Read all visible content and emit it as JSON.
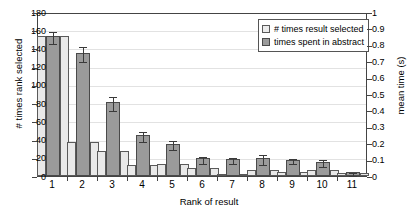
{
  "chart_data": {
    "type": "bar",
    "title": "",
    "xlabel": "Rank of result",
    "ylabel": "# times rank selected",
    "ylabel_right": "mean time (s)",
    "categories": [
      "1",
      "2",
      "3",
      "4",
      "5",
      "6",
      "7",
      "8",
      "9",
      "10",
      "11"
    ],
    "ylim": [
      0,
      180
    ],
    "yticks": [
      0,
      20,
      40,
      60,
      80,
      100,
      120,
      140,
      160,
      180
    ],
    "ylim_right": [
      0,
      1
    ],
    "yticks_right": [
      "0",
      "0.1",
      "0.2",
      "0.3",
      "0.4",
      "0.5",
      "0.6",
      "0.7",
      "0.8",
      "0.9",
      "1"
    ],
    "grid": true,
    "legend_position": "top-right",
    "series": [
      {
        "name": "# times result selected",
        "axis": "left",
        "color": "#e9e9e9",
        "values": [
          154,
          37,
          28,
          12,
          13,
          9,
          2,
          7,
          4,
          7,
          3
        ]
      },
      {
        "name": "times spent in abstract",
        "axis": "right",
        "color": "#9b9b9b",
        "values": [
          0.855,
          0.752,
          0.451,
          0.249,
          0.196,
          0.108,
          0.103,
          0.108,
          0.1,
          0.087,
          0.022
        ],
        "errors": [
          0.035,
          0.047,
          0.04,
          0.03,
          0.028,
          0.022,
          0.017,
          0.03,
          0.017,
          0.022,
          0.011
        ]
      }
    ]
  },
  "legend": {
    "items": [
      {
        "label": "# times result selected",
        "swatch": "light"
      },
      {
        "label": "times spent in abstract",
        "swatch": "dark"
      }
    ]
  },
  "axes": {
    "left_title": "# times rank selected",
    "right_title": "mean time (s)",
    "bottom_title": "Rank of result"
  }
}
